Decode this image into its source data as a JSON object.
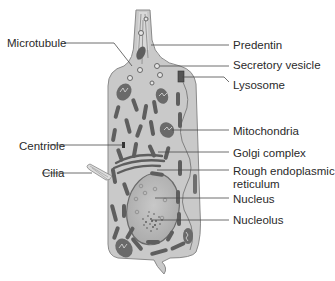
{
  "diagram": {
    "colors": {
      "cytoplasm": "#c9c9c9",
      "outline": "#8a8a8a",
      "organelle": "#5e5e5e",
      "nucleus": "#b6b6b6",
      "leader_line": "#4a4a4a",
      "text": "#2a2a2a"
    },
    "labels_left": [
      {
        "id": "microtubule",
        "text": "Microtubule"
      },
      {
        "id": "centriole",
        "text": "Centriole"
      },
      {
        "id": "cilia",
        "text": "Cilia"
      }
    ],
    "labels_right": [
      {
        "id": "predentin",
        "text": "Predentin"
      },
      {
        "id": "secretory-vesicle",
        "text": "Secretory vesicle"
      },
      {
        "id": "lysosome",
        "text": "Lysosome"
      },
      {
        "id": "mitochondria",
        "text": "Mitochondria"
      },
      {
        "id": "golgi-complex",
        "text": "Golgi complex"
      },
      {
        "id": "rough-er",
        "text": "Rough endoplasmic reticulum",
        "line1": "Rough endoplasmic",
        "line2": "reticulum"
      },
      {
        "id": "nucleus",
        "text": "Nucleus"
      },
      {
        "id": "nucleolus",
        "text": "Nucleolus"
      }
    ]
  }
}
